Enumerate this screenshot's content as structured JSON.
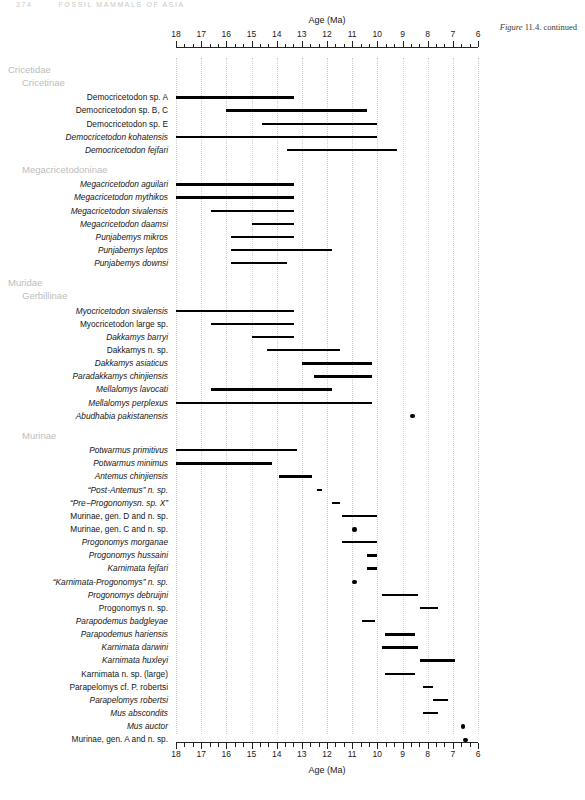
{
  "running_head": {
    "folio": "374",
    "text": "FOSSIL MAMMALS OF ASIA"
  },
  "figure_caption": {
    "fig": "Figure",
    "rest": "11.4. continued"
  },
  "chart_data": {
    "type": "range-bar",
    "title": "",
    "xlabel": "Age (Ma)",
    "ylabel": "",
    "xlim": [
      18,
      6
    ],
    "xticks": [
      18,
      17,
      16,
      15,
      14,
      13,
      12,
      11,
      10,
      9,
      8,
      7,
      6
    ],
    "xtick_labels": [
      "18",
      "17",
      "16",
      "15",
      "14",
      "13",
      "12",
      "11",
      "10",
      "9",
      "8",
      "7",
      "6"
    ],
    "minor_ticks_per_interval": 2,
    "grid": true,
    "axis_top": true,
    "axis_bottom": true,
    "units": "Ma",
    "note": "Biostratigraphic range chart; each taxon plotted as a horizontal range bar (first/last occurrence in Ma). Single occurrences plotted as dots.",
    "groups": [
      {
        "name": "Cricetidae",
        "indent": 0,
        "subgroups": [
          {
            "name": "Cricetinae",
            "indent": 1,
            "taxa": [
              {
                "label": "Democricetodon sp. A",
                "italic_part": "Democricetodon",
                "plain_part": " sp. A",
                "start": 18.0,
                "end": 13.3,
                "kind": "bar"
              },
              {
                "label": "Democricetodon sp. B, C",
                "italic_part": "Democricetodon",
                "plain_part": " sp. B, C",
                "start": 16.0,
                "end": 10.4,
                "kind": "bar"
              },
              {
                "label": "Democricetodon sp. E",
                "italic_part": "Democricetodon",
                "plain_part": " sp. E",
                "start": 14.6,
                "end": 10.0,
                "kind": "bar"
              },
              {
                "label": "Democricetodon kohatensis",
                "italic_part": "Democricetodon kohatensis",
                "plain_part": "",
                "start": 18.0,
                "end": 10.0,
                "kind": "bar"
              },
              {
                "label": "Democricetodon fejfari",
                "italic_part": "Democricetodon fejfari",
                "plain_part": "",
                "start": 13.6,
                "end": 9.2,
                "kind": "bar"
              }
            ]
          },
          {
            "name": "Megacricetodoninae",
            "indent": 1,
            "taxa": [
              {
                "label": "Megacricetodon aguilari",
                "italic_part": "Megacricetodon aguilari",
                "plain_part": "",
                "start": 18.0,
                "end": 13.3,
                "kind": "bar"
              },
              {
                "label": "Megacricetodon mythikos",
                "italic_part": "Megacricetodon mythikos",
                "plain_part": "",
                "start": 18.0,
                "end": 13.3,
                "kind": "bar"
              },
              {
                "label": "Megacricetodon sivalensis",
                "italic_part": "Megacricetodon sivalensis",
                "plain_part": "",
                "start": 16.6,
                "end": 13.3,
                "kind": "bar"
              },
              {
                "label": "Megacricetodon daamsi",
                "italic_part": "Megacricetodon daamsi",
                "plain_part": "",
                "start": 15.0,
                "end": 13.3,
                "kind": "bar"
              },
              {
                "label": "Punjabemys mikros",
                "italic_part": "Punjabemys mikros",
                "plain_part": "",
                "start": 15.8,
                "end": 13.3,
                "kind": "bar"
              },
              {
                "label": "Punjabemys leptos",
                "italic_part": "Punjabemys leptos",
                "plain_part": "",
                "start": 15.8,
                "end": 11.8,
                "kind": "bar"
              },
              {
                "label": "Punjabemys downsi",
                "italic_part": "Punjabemys downsi",
                "plain_part": "",
                "start": 15.8,
                "end": 13.6,
                "kind": "bar"
              }
            ]
          }
        ]
      },
      {
        "name": "Muridae",
        "indent": 0,
        "subgroups": [
          {
            "name": "Gerbillinae",
            "indent": 1,
            "taxa": [
              {
                "label": "Myocricetodon sivalensis",
                "italic_part": "Myocricetodon sivalensis",
                "plain_part": "",
                "start": 18.0,
                "end": 13.3,
                "kind": "bar"
              },
              {
                "label": "Myocricetodon large sp.",
                "italic_part": "Myocricetodon",
                "plain_part": " large sp.",
                "start": 16.6,
                "end": 13.3,
                "kind": "bar"
              },
              {
                "label": "Dakkamys barryi",
                "italic_part": "Dakkamys barryi",
                "plain_part": "",
                "start": 15.0,
                "end": 13.3,
                "kind": "bar"
              },
              {
                "label": "Dakkamys n. sp.",
                "italic_part": "Dakkamys",
                "plain_part": " n. sp.",
                "start": 14.4,
                "end": 11.5,
                "kind": "bar"
              },
              {
                "label": "Dakkamys asiaticus",
                "italic_part": "Dakkamys asiaticus",
                "plain_part": "",
                "start": 13.0,
                "end": 10.2,
                "kind": "bar"
              },
              {
                "label": "Paradakkamys chinjiensis",
                "italic_part": "Paradakkamys chinjiensis",
                "plain_part": "",
                "start": 12.5,
                "end": 10.2,
                "kind": "bar"
              },
              {
                "label": "Mellalomys lavocati",
                "italic_part": "Mellalomys lavocati",
                "plain_part": "",
                "start": 16.6,
                "end": 11.8,
                "kind": "bar"
              },
              {
                "label": "Mellalomys perplexus",
                "italic_part": "Mellalomys perplexus",
                "plain_part": "",
                "start": 18.0,
                "end": 10.2,
                "kind": "bar"
              },
              {
                "label": "Abudhabia pakistanensis",
                "italic_part": "Abudhabia pakistanensis",
                "plain_part": "",
                "start": 8.6,
                "end": 8.6,
                "kind": "dot"
              }
            ]
          },
          {
            "name": "Murinae",
            "indent": 1,
            "taxa": [
              {
                "label": "Potwarmus primitivus",
                "italic_part": "Potwarmus primitivus",
                "plain_part": "",
                "start": 18.0,
                "end": 13.2,
                "kind": "bar"
              },
              {
                "label": "Potwarmus minimus",
                "italic_part": "Potwarmus minimus",
                "plain_part": "",
                "start": 18.0,
                "end": 14.2,
                "kind": "bar"
              },
              {
                "label": "Antemus chinjiensis",
                "italic_part": "Antemus chinjiensis",
                "plain_part": "",
                "start": 13.9,
                "end": 12.6,
                "kind": "bar"
              },
              {
                "label": "“Post-Antemus” n. sp.",
                "italic_part": "Antemus",
                "plain_part": "",
                "start": 12.4,
                "end": 12.2,
                "kind": "bar"
              },
              {
                "label": "“Pre−Progonomysn. sp. X”",
                "italic_part": "Progonomys",
                "plain_part": "",
                "start": 11.8,
                "end": 11.5,
                "kind": "bar"
              },
              {
                "label": "Murinae, gen. D and n. sp.",
                "italic_part": "",
                "plain_part": "Murinae, gen. D and n. sp.",
                "start": 11.4,
                "end": 10.0,
                "kind": "bar"
              },
              {
                "label": "Murinae, gen. C and n. sp.",
                "italic_part": "",
                "plain_part": "Murinae, gen. C and n. sp.",
                "start": 10.9,
                "end": 10.9,
                "kind": "dot"
              },
              {
                "label": "Progonomys morganae",
                "italic_part": "Progonomys morganae",
                "plain_part": "",
                "start": 11.4,
                "end": 10.0,
                "kind": "bar"
              },
              {
                "label": "Progonomys hussaini",
                "italic_part": "Progonomys hussaini",
                "plain_part": "",
                "start": 10.4,
                "end": 10.0,
                "kind": "bar"
              },
              {
                "label": "Karnimata fejfari",
                "italic_part": "Karnimata fejfari",
                "plain_part": "",
                "start": 10.4,
                "end": 10.0,
                "kind": "bar"
              },
              {
                "label": "“Karnimata-Progonomys” n. sp.",
                "italic_part": "Karnimata-Progonomys",
                "plain_part": "",
                "start": 10.9,
                "end": 10.9,
                "kind": "dot"
              },
              {
                "label": "Progonomys debruijni",
                "italic_part": "Progonomys debruijni",
                "plain_part": "",
                "start": 9.8,
                "end": 8.4,
                "kind": "bar"
              },
              {
                "label": "Progonomys n. sp.",
                "italic_part": "Progonomys",
                "plain_part": " n. sp.",
                "start": 8.3,
                "end": 7.6,
                "kind": "bar"
              },
              {
                "label": "Parapodemus badgleyae",
                "italic_part": "Parapodemus badgleyae",
                "plain_part": "",
                "start": 10.6,
                "end": 10.1,
                "kind": "bar"
              },
              {
                "label": "Parapodemus hariensis",
                "italic_part": "Parapodemus hariensis",
                "plain_part": "",
                "start": 9.7,
                "end": 8.5,
                "kind": "bar"
              },
              {
                "label": "Karnimata darwini",
                "italic_part": "Karnimata darwini",
                "plain_part": "",
                "start": 9.8,
                "end": 8.4,
                "kind": "bar"
              },
              {
                "label": "Karnimata huxleyi",
                "italic_part": "Karnimata huxleyi",
                "plain_part": "",
                "start": 8.3,
                "end": 6.9,
                "kind": "bar"
              },
              {
                "label": "Karnimata n. sp. (large)",
                "italic_part": "Karnimata",
                "plain_part": " n. sp. (large)",
                "start": 9.7,
                "end": 8.5,
                "kind": "bar"
              },
              {
                "label": "Parapelomys cf. P. robertsi",
                "italic_part": "Parapelomys",
                "plain_part": " cf. ",
                "start": 8.2,
                "end": 7.8,
                "kind": "bar"
              },
              {
                "label": "Parapelomys robertsi",
                "italic_part": "Parapelomys robertsi",
                "plain_part": "",
                "start": 7.8,
                "end": 7.2,
                "kind": "bar"
              },
              {
                "label": "Mus abscondits",
                "italic_part": "Mus abscondits",
                "plain_part": "",
                "start": 8.2,
                "end": 7.6,
                "kind": "bar"
              },
              {
                "label": "Mus auctor",
                "italic_part": "Mus auctor",
                "plain_part": "",
                "start": 6.6,
                "end": 6.6,
                "kind": "dot"
              },
              {
                "label": "Murinae, gen. A and n. sp.",
                "italic_part": "",
                "plain_part": "Murinae, gen. A and n. sp.",
                "start": 6.5,
                "end": 6.5,
                "kind": "dot"
              }
            ]
          }
        ]
      }
    ]
  }
}
